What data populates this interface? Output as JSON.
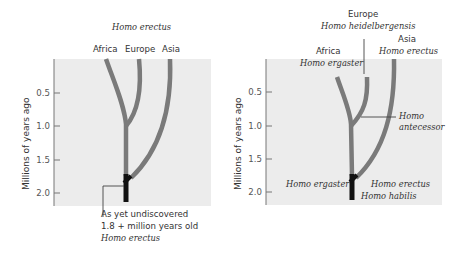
{
  "left_panel": {
    "title": "Homo erectus",
    "regions": [
      "Africa",
      "Europe",
      "Asia"
    ],
    "y_axis_label": "Millions of years ago",
    "y_ticks": [
      "0.5",
      "1.0",
      "1.5",
      "2.0"
    ],
    "annotation": {
      "line1": "As yet undiscovered",
      "line2": "1.8 + million years old",
      "line3": "Homo erectus"
    }
  },
  "right_panel": {
    "europe": {
      "region": "Europe",
      "species": "Homo heidelbergensis"
    },
    "asia": {
      "region": "Asia",
      "species": "Homo erectus"
    },
    "africa": {
      "region": "Africa",
      "species": "Homo ergaster"
    },
    "antecessor": {
      "line1": "Homo",
      "line2": "antecessor"
    },
    "y_axis_label": "Millions of years ago",
    "y_ticks": [
      "0.5",
      "1.0",
      "1.5",
      "2.0"
    ],
    "bottom_labels": {
      "ergaster": "Homo ergaster",
      "erectus": "Homo erectus",
      "habilis": "Homo habilis"
    }
  },
  "colors": {
    "panel_bg": "#ececec",
    "branch": "#7a7a7a",
    "stem": "#111111",
    "axis": "#777777"
  }
}
